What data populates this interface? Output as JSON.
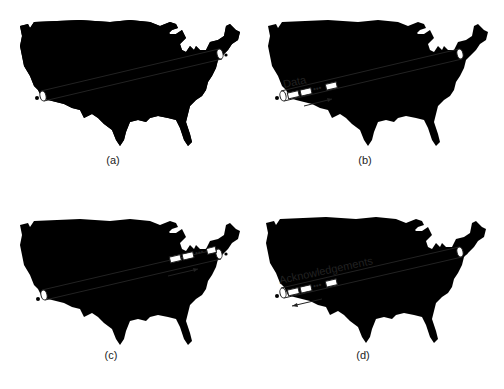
{
  "figure": {
    "panels": [
      {
        "id": "a",
        "caption": "(a)",
        "packet_position": "none",
        "label": "",
        "arrow_direction": "none"
      },
      {
        "id": "b",
        "caption": "(b)",
        "packet_position": "west",
        "label": "Data",
        "arrow_direction": "east"
      },
      {
        "id": "c",
        "caption": "(c)",
        "packet_position": "east",
        "label": "",
        "arrow_direction": "east"
      },
      {
        "id": "d",
        "caption": "(d)",
        "packet_position": "west",
        "label": "Acknowledgements",
        "arrow_direction": "west"
      }
    ],
    "packet_ellipsis": "•••"
  }
}
